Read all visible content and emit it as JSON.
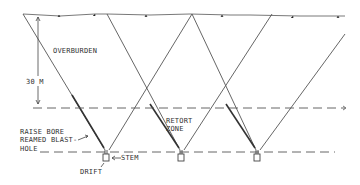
{
  "diagram": {
    "labels": {
      "overburden": "OVERBURDEN",
      "depth": "30 M",
      "retort_zone_line1": "RETORT",
      "retort_zone_line2": "ZONE",
      "raise_bore_line1": "RAISE BORE",
      "raise_bore_line2": "REAMED BLAST-",
      "raise_bore_line3": "HOLE",
      "stem": "STEM",
      "drift": "DRIFT"
    },
    "colors": {
      "line": "#555555",
      "text": "#333333",
      "background": "#ffffff"
    }
  }
}
